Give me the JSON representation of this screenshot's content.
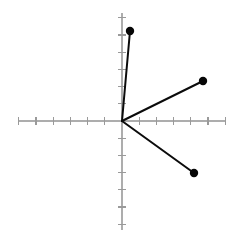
{
  "figure": {
    "title": "",
    "background_color": "#ffffff",
    "width": 241,
    "height": 241
  },
  "chart_data": {
    "type": "scatter",
    "title": "",
    "xlabel": "",
    "ylabel": "",
    "grid": false,
    "legend": null,
    "legend_position": "none",
    "xlim": [
      -6.1,
      6.1
    ],
    "ylim": [
      -6.4,
      6.4
    ],
    "xticks": [
      -6,
      -5,
      -4,
      -3,
      -2,
      -1,
      1,
      2,
      3,
      4,
      5,
      6
    ],
    "yticks": [
      -6,
      -5,
      -4,
      -3,
      -2,
      -1,
      1,
      2,
      3,
      4,
      5,
      6
    ],
    "xtick_labels": [],
    "ytick_labels": [],
    "origin": [
      0,
      0
    ],
    "series": [
      {
        "name": "vector-1",
        "kind": "vector",
        "color": "#0b0b0b",
        "x": [
          0,
          0.5
        ],
        "y": [
          0,
          5.3
        ],
        "marker": "dot-filled",
        "marker_at": "endpoint"
      },
      {
        "name": "vector-2",
        "kind": "vector",
        "color": "#0b0b0b",
        "x": [
          0,
          4.8
        ],
        "y": [
          0,
          2.4
        ],
        "marker": "dot-filled",
        "marker_at": "endpoint"
      },
      {
        "name": "vector-3",
        "kind": "vector",
        "color": "#0b0b0b",
        "x": [
          0,
          4.2
        ],
        "y": [
          0,
          -3.1
        ],
        "marker": "dot-filled",
        "marker_at": "endpoint"
      }
    ],
    "points": [
      {
        "label": "",
        "x": 0.5,
        "y": 5.3
      },
      {
        "label": "",
        "x": 4.8,
        "y": 2.4
      },
      {
        "label": "",
        "x": 4.2,
        "y": -3.1
      }
    ],
    "axis_color": "#adadad",
    "tick_color": "#9a9a9a",
    "vector_color": "#0b0b0b"
  },
  "geometry": {
    "origin_px": {
      "x": 122,
      "y": 121
    },
    "unit_px": 17.2,
    "x_axis_px": {
      "x1": 18,
      "x2": 226
    },
    "y_axis_px": {
      "y1": 13,
      "y2": 230
    },
    "tick_half_len_px": 4,
    "dot_radius_px": 4.2,
    "endpoints_px": [
      {
        "x": 130,
        "y": 31
      },
      {
        "x": 203,
        "y": 81
      },
      {
        "x": 194,
        "y": 173
      }
    ]
  }
}
